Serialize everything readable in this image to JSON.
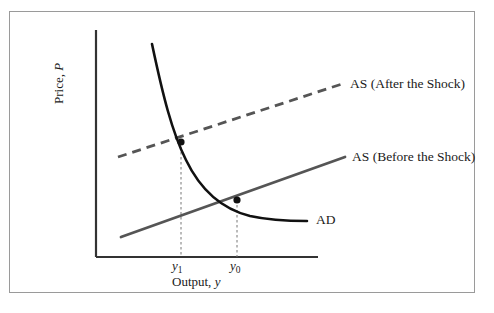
{
  "chart_data": {
    "type": "line",
    "title": "",
    "xlabel": "Output, y",
    "ylabel": "Price, P",
    "grid": false,
    "legend_position": "inline-right-of-curves",
    "axis_ranges": {
      "x": [
        96,
        318
      ],
      "y": [
        30,
        257
      ]
    },
    "annotations": {
      "x_ticks": [
        {
          "label": "y",
          "sub": "1",
          "x_px": 181
        },
        {
          "label": "y",
          "sub": "0",
          "x_px": 237
        }
      ],
      "equilibria": [
        {
          "name": "after-shock-equilibrium",
          "x_px": 181,
          "y_px": 142
        },
        {
          "name": "before-shock-equilibrium",
          "x_px": 237,
          "y_px": 200
        }
      ]
    },
    "series": [
      {
        "name": "AD",
        "label": "AD",
        "style": "solid",
        "color": "#111111",
        "width": 2.6,
        "path": "M 152,44 C 163,96 172,132 186,160 C 200,189 222,209 250,216 C 268,220 290,221 307,221"
      },
      {
        "name": "AS (Before the Shock)",
        "label": "AS (Before the Shock)",
        "style": "solid",
        "color": "#555555",
        "width": 2.8,
        "path": "M 121,237 L 345,157"
      },
      {
        "name": "AS (After the Shock)",
        "label": "AS (After the Shock)",
        "style": "dashed",
        "color": "#555555",
        "width": 2.8,
        "dash": "9,6",
        "path": "M 118,157 L 342,84"
      }
    ]
  },
  "labels": {
    "as_after": "AS (After the Shock)",
    "as_before": "AS (Before the Shock)",
    "ad": "AD",
    "y_axis_prefix": "Price, ",
    "y_axis_symbol": "P",
    "x_axis_prefix": "Output, ",
    "x_axis_symbol": "y",
    "tick_y1_base": "y",
    "tick_y1_sub": "1",
    "tick_y0_base": "y",
    "tick_y0_sub": "0"
  },
  "colors": {
    "border": "#9a9a9a",
    "axis": "#333333",
    "ad_curve": "#111111",
    "as_line": "#555555",
    "dropline": "#777777",
    "background": "#ffffff"
  }
}
